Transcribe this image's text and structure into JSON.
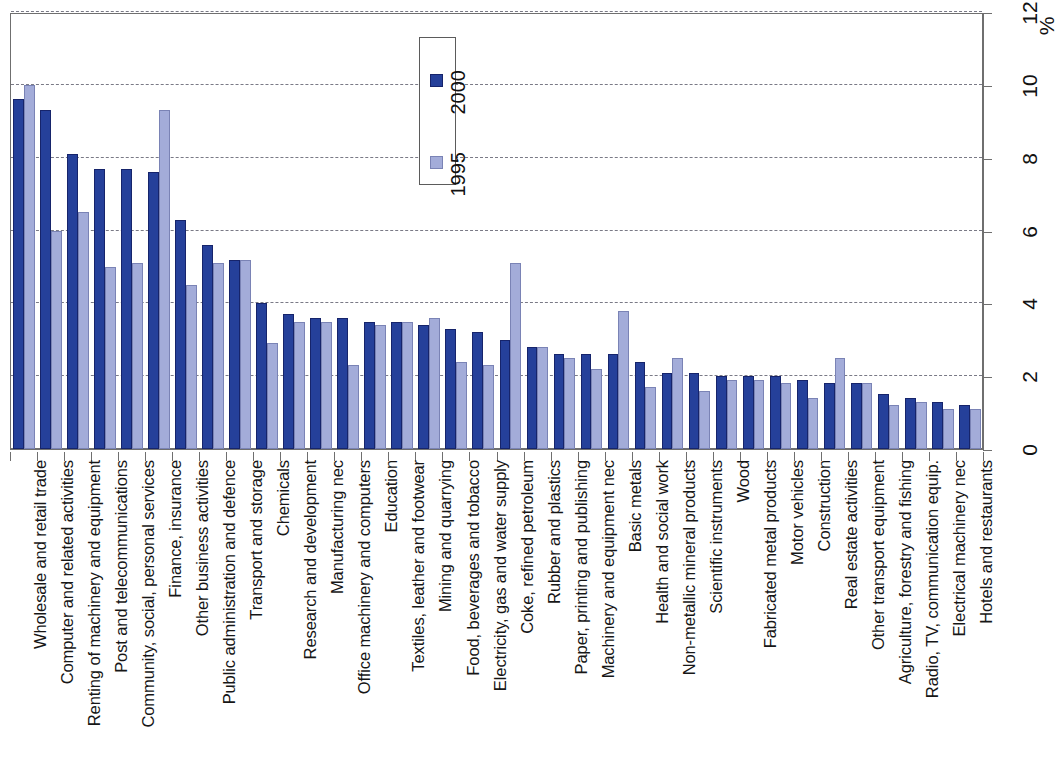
{
  "chart_data": {
    "type": "bar",
    "title": "",
    "subtitle": "",
    "xlabel": "",
    "ylabel": "%",
    "ylim": [
      0,
      12
    ],
    "yticks": [
      0,
      2,
      4,
      6,
      8,
      10,
      12
    ],
    "ytick_labels": [
      "0",
      "2",
      "4",
      "6",
      "8",
      "10",
      "12"
    ],
    "grid": true,
    "grid_axis": "y",
    "legend_position": "top-center",
    "orientation": "vertical-bars-rotated-page",
    "colors": {
      "series_1995": "#a3acd9",
      "series_2000": "#25409a",
      "axis": "#6f6f6f",
      "grid": "#7a7a86",
      "text": "#161616",
      "background": "#ffffff"
    },
    "categories": [
      "Wholesale and retail trade",
      "Computer and related activities",
      "Renting of machinery and equipment",
      "Post and telecommunications",
      "Community, social, personal services",
      "Finance, insurance",
      "Other business activities",
      "Public administration and defence",
      "Transport and storage",
      "Chemicals",
      "Research and development",
      "Manufacturing nec",
      "Office machinery and computers",
      "Education",
      "Textiles, leather and footwear",
      "Mining and quarrying",
      "Food, beverages and tobacco",
      "Electricity, gas and water supply",
      "Coke, refined petroleum",
      "Rubber and plastics",
      "Paper, printing and publishing",
      "Machinery and equipment nec",
      "Basic metals",
      "Health and social work",
      "Non-metallic mineral products",
      "Scientific instruments",
      "Wood",
      "Fabricated metal products",
      "Motor vehicles",
      "Construction",
      "Real estate activities",
      "Other transport equipment",
      "Agriculture, forestry and fishing",
      "Radio, TV, communication equip.",
      "Electrical machinery nec",
      "Hotels and restaurants"
    ],
    "series": [
      {
        "name": "2000",
        "color": "#25409a",
        "values": [
          9.6,
          9.3,
          8.1,
          7.7,
          7.7,
          7.6,
          6.3,
          5.6,
          5.2,
          4.0,
          3.7,
          3.6,
          3.6,
          3.5,
          3.5,
          3.4,
          3.3,
          3.2,
          3.0,
          2.8,
          2.6,
          2.6,
          2.6,
          2.4,
          2.1,
          2.1,
          2.0,
          2.0,
          2.0,
          1.9,
          1.8,
          1.8,
          1.5,
          1.4,
          1.3,
          1.2
        ]
      },
      {
        "name": "1995",
        "color": "#a3acd9",
        "values": [
          10.0,
          6.0,
          6.5,
          5.0,
          5.1,
          9.3,
          4.5,
          5.1,
          5.2,
          2.9,
          3.5,
          3.5,
          2.3,
          3.4,
          3.5,
          3.6,
          2.4,
          2.3,
          5.1,
          2.8,
          2.5,
          2.2,
          3.8,
          1.7,
          2.5,
          1.6,
          1.9,
          1.9,
          1.8,
          1.4,
          2.5,
          1.8,
          1.2,
          1.3,
          1.1,
          1.1
        ]
      }
    ],
    "legend": [
      {
        "label": "1995",
        "color": "#a3acd9"
      },
      {
        "label": "2000",
        "color": "#25409a"
      }
    ]
  }
}
